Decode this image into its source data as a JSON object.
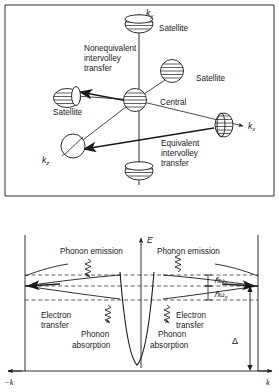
{
  "figure": {
    "title_semantic": "intervalley-transfer-and-energy-band-diagram",
    "panels": [
      {
        "id": "upper",
        "name": "k-space-valley-diagram",
        "axes": [
          {
            "name": "ky-axis",
            "label": "k",
            "subscript": "y"
          },
          {
            "name": "kx-axis",
            "label": "k",
            "subscript": "x"
          },
          {
            "name": "kz-axis",
            "label": "k",
            "subscript": "z"
          }
        ],
        "valleys": [
          {
            "name": "satellite-top",
            "label": "Satellite",
            "shape": "ellipse-hatched"
          },
          {
            "name": "satellite-upper-right",
            "label": "Satellite",
            "shape": "circle-hatched"
          },
          {
            "name": "satellite-left",
            "label": "Satellite",
            "shape": "ellipse-hatched"
          },
          {
            "name": "central-valley",
            "label": "Central",
            "shape": "circle-hatched"
          },
          {
            "name": "satellite-kx",
            "label": "",
            "shape": "ellipse-hatched"
          },
          {
            "name": "satellite-kz",
            "label": "",
            "shape": "circle-plain"
          },
          {
            "name": "satellite-bottom",
            "label": "",
            "shape": "ellipse-hatched"
          }
        ],
        "annotations": [
          {
            "name": "nonequivalent-transfer-label",
            "lines": [
              "Nonequivalent",
              "intervolley",
              "transfer"
            ]
          },
          {
            "name": "equivalent-transfer-label",
            "lines": [
              "Equivalent",
              "intervolley",
              "transfer"
            ]
          }
        ]
      },
      {
        "id": "lower",
        "name": "energy-vs-k-diagram",
        "axes": [
          {
            "name": "energy-axis",
            "label": "E"
          },
          {
            "name": "k-axis-negative",
            "label": "−k"
          },
          {
            "name": "k-axis-positive",
            "label": "k"
          }
        ],
        "annotations": [
          {
            "name": "phonon-emission-left",
            "text": "Phonon emission"
          },
          {
            "name": "phonon-emission-right",
            "text": "Phonon emission"
          },
          {
            "name": "electron-transfer-left",
            "lines": [
              "Electron",
              "transfer"
            ]
          },
          {
            "name": "electron-transfer-right",
            "lines": [
              "Electron",
              "transfer"
            ]
          },
          {
            "name": "phonon-absorption-left",
            "lines": [
              "Phonon",
              "absorption"
            ]
          },
          {
            "name": "phonon-absorption-right",
            "lines": [
              "Phonon",
              "absorption"
            ]
          },
          {
            "name": "hbar-omega-upper",
            "symbol": "ℏω",
            "subscript": "n"
          },
          {
            "name": "hbar-omega-lower",
            "symbol": "ℏω",
            "subscript": "n"
          },
          {
            "name": "delta-gap-label",
            "symbol": "Δ"
          }
        ]
      }
    ],
    "colors": {
      "ink": "#1a1a1a",
      "background": "#ffffff"
    }
  }
}
